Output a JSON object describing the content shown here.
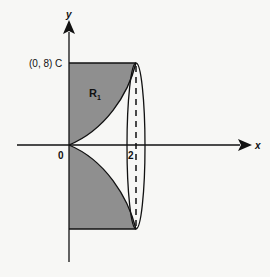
{
  "diagram": {
    "axis_labels": {
      "x": "x",
      "y": "y"
    },
    "point_C": "(0, 8) C",
    "origin_label": "0",
    "x_tick_label": "2",
    "region_label": "R",
    "region_subscript": "1",
    "colors": {
      "background": "#f7f7f5",
      "shaded_region": "#8f8f8f",
      "lines": "#111111"
    }
  }
}
